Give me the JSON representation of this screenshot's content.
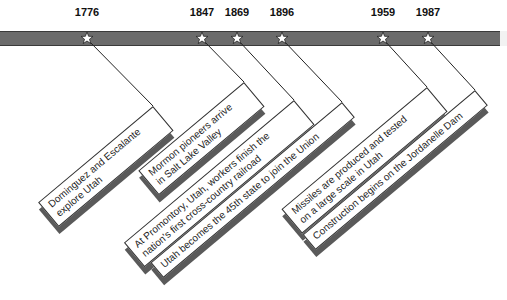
{
  "timeline": {
    "bar_color": "#6b6b6b",
    "events": [
      {
        "year": "1776",
        "x": 87,
        "lines": [
          "Dominguez and Escalante",
          "explore Utah"
        ]
      },
      {
        "year": "1847",
        "x": 202,
        "lines": [
          "Mormon pioneers arrive",
          "in Salt Lake Valley"
        ]
      },
      {
        "year": "1869",
        "x": 237,
        "lines": [
          "At Promontory, Utah, workers finish the",
          "nation's first cross-country railroad"
        ]
      },
      {
        "year": "1896",
        "x": 282,
        "lines": [
          "Utah becomes the 45th state to join the Union"
        ]
      },
      {
        "year": "1959",
        "x": 383,
        "lines": [
          "Missiles are produced and tested",
          "on a large scale in Utah"
        ]
      },
      {
        "year": "1987",
        "x": 428,
        "lines": [
          "Construction begins on the Jordanelle Dam"
        ]
      }
    ]
  }
}
